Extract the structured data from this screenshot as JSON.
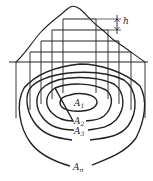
{
  "diagram": {
    "height_label": "h",
    "contours": [
      {
        "label": "A",
        "sub": "1"
      },
      {
        "label": "A",
        "sub": "2"
      },
      {
        "label": "A",
        "sub": "3"
      },
      {
        "label": "A",
        "sub": "n"
      }
    ],
    "colors": {
      "stroke": "#222222",
      "background": "#ffffff"
    }
  }
}
